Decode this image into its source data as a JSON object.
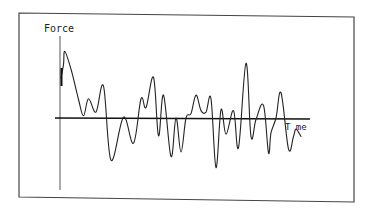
{
  "chart_data": {
    "type": "line",
    "title": "",
    "xlabel": "Time",
    "ylabel": "Force",
    "xlabel_rendered": "T me",
    "grid": false,
    "legend": null,
    "axes_ticks": false,
    "x_units": "relative (0-100)",
    "y_units": "relative (positive up, zero at x-axis)",
    "series": [
      {
        "name": "Force",
        "x": [
          0,
          1,
          1.5,
          4,
          7,
          9,
          11,
          14,
          17,
          20,
          25,
          29,
          32,
          34,
          37,
          39,
          41,
          44,
          46,
          48,
          50,
          52,
          54,
          56,
          58,
          60,
          62,
          64,
          66,
          69,
          71,
          74,
          76,
          78,
          81,
          83,
          84,
          86,
          88,
          91,
          93,
          94,
          96
        ],
        "y": [
          54,
          72,
          90,
          66,
          25,
          3,
          26,
          8,
          43,
          -57,
          1,
          -34,
          26,
          14,
          55,
          -24,
          31,
          -52,
          0,
          -46,
          0,
          6,
          31,
          10,
          8,
          26,
          -67,
          11,
          -22,
          10,
          -40,
          74,
          -25,
          -2,
          17,
          -47,
          -20,
          0,
          34,
          -42,
          -25,
          -15,
          -25
        ]
      }
    ]
  },
  "labels": {
    "y_axis": "Force",
    "x_axis": "T me"
  },
  "colors": {
    "line": "#222222",
    "axis": "#111111",
    "frame": "#444444",
    "background": "#ffffff"
  }
}
